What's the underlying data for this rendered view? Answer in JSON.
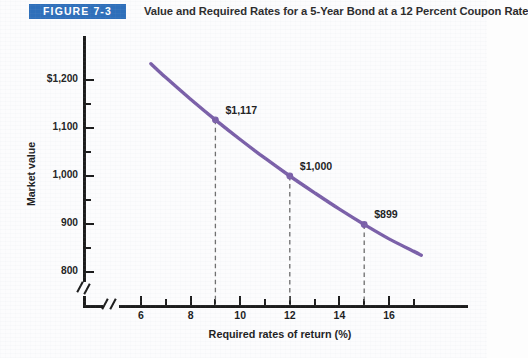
{
  "figure": {
    "badge": "FIGURE 7-3",
    "title": "Value and Required Rates for a 5-Year Bond at a 12 Percent Coupon Rate",
    "badge_color": "#2e6fba",
    "curve_color": "#7a5fa8"
  },
  "chart_data": {
    "type": "line",
    "title": "Value and Required Rates for a 5-Year Bond at a 12 Percent Coupon Rate",
    "xlabel": "Required rates of return (%)",
    "ylabel": "Market value",
    "xlim": [
      5.0,
      17.4
    ],
    "ylim": [
      775,
      1255
    ],
    "grid": false,
    "legend": "none",
    "x_ticks_major": [
      6,
      8,
      10,
      12,
      14,
      16
    ],
    "x_tick_labels": [
      "6",
      "8",
      "10",
      "12",
      "14",
      "16"
    ],
    "x_ticks_minor": [
      7,
      9,
      11,
      13,
      15,
      17
    ],
    "y_ticks_major": [
      800,
      900,
      1000,
      1100,
      1200
    ],
    "y_tick_labels": [
      "800",
      "900",
      "1,000",
      "1,100",
      "$1,200"
    ],
    "y_ticks_minor": [
      850,
      950,
      1050,
      1150
    ],
    "axis_break_x": true,
    "axis_break_y": true,
    "series": [
      {
        "name": "Bond value",
        "color": "#7a5fa8",
        "x": [
          6.4,
          7.0,
          8.0,
          9.0,
          10.0,
          11.0,
          12.0,
          13.0,
          14.0,
          15.0,
          16.0,
          17.0,
          17.3
        ],
        "y": [
          1234,
          1205,
          1160,
          1117,
          1076,
          1037,
          1000,
          965,
          931,
          899,
          869,
          843,
          835
        ]
      }
    ],
    "annotations": [
      {
        "label": "$1,117",
        "x": 9,
        "y": 1117,
        "dropline": true
      },
      {
        "label": "$1,000",
        "x": 12,
        "y": 1000,
        "dropline": true
      },
      {
        "label": "$899",
        "x": 15,
        "y": 899,
        "dropline": true
      }
    ]
  }
}
